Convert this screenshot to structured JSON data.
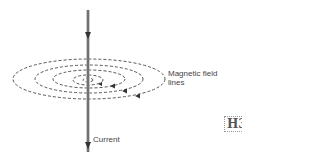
{
  "diagram": {
    "labels": {
      "field_lines": "Magnetic field lines",
      "field_lines_line1": "Magnetic field",
      "field_lines_line2": "lines",
      "current": "Current"
    },
    "badge": "H3",
    "colors": {
      "wire": "#9a9a9a",
      "arrow": "#333333",
      "field_lines": "#444444",
      "text": "#444444"
    }
  }
}
